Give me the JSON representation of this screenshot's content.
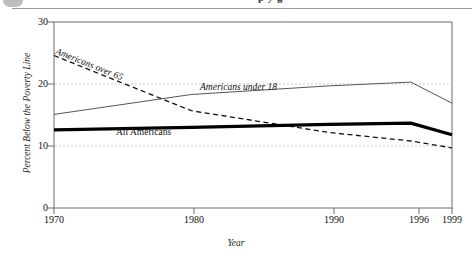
{
  "header": {
    "cut_off_text": "p y g",
    "blob_icon": "partial-circle-icon"
  },
  "chart_data": {
    "type": "line",
    "title": "",
    "xlabel": "Year",
    "ylabel": "Percent Below the Poverty Line",
    "x": [
      1970,
      1980,
      1990,
      1996,
      1999
    ],
    "xtick_labels": [
      "1970",
      "1980",
      "1990",
      "1996",
      "1999"
    ],
    "ytick_labels": [
      "0",
      "10",
      "20",
      "30"
    ],
    "yticks": [
      0,
      10,
      20,
      30
    ],
    "xlim": [
      1970,
      1999
    ],
    "ylim": [
      0,
      30
    ],
    "grid": "horizontal-dotted-at-10-and-20",
    "legend": "inline-labels",
    "series": [
      {
        "name": "Americans over 65",
        "style": "dashed",
        "color": "#111111",
        "values": [
          24.6,
          15.7,
          12.2,
          10.8,
          9.7
        ]
      },
      {
        "name": "Americans under 18",
        "style": "thin-solid",
        "color": "#555555",
        "values": [
          15.1,
          18.3,
          19.7,
          20.3,
          16.9
        ]
      },
      {
        "name": "All Americans",
        "style": "bold-solid",
        "color": "#000000",
        "values": [
          12.6,
          13.0,
          13.5,
          13.7,
          11.8
        ]
      }
    ]
  }
}
